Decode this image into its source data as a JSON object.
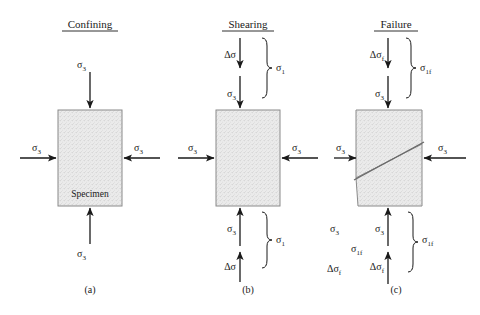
{
  "figure": {
    "background": "#ffffff",
    "ink": "#1a1a1a",
    "specimen_fill": "#e8e8e8",
    "specimen_border": "#888888"
  },
  "panels": [
    {
      "id": "a",
      "title": "Confining",
      "caption": "(a)",
      "specimen_label": "Specimen",
      "arrows": {
        "top": "σ",
        "top_sub": "3",
        "bottom": "σ",
        "bottom_sub": "3",
        "left": "σ",
        "left_sub": "3",
        "right": "σ",
        "right_sub": "3"
      },
      "has_failure_plane": false,
      "has_brace": false
    },
    {
      "id": "b",
      "title": "Shearing",
      "caption": "(b)",
      "specimen_label": "",
      "arrows": {
        "top_outer": "Δσ",
        "top_inner": "σ",
        "top_inner_sub": "3",
        "bottom_inner": "σ",
        "bottom_inner_sub": "3",
        "bottom_outer": "Δσ",
        "left": "σ",
        "left_sub": "3",
        "right": "σ",
        "right_sub": "3"
      },
      "brace_top_label": "σ",
      "brace_top_sub": "1",
      "brace_bottom_label": "σ",
      "brace_bottom_sub": "1",
      "has_failure_plane": false,
      "has_brace": true
    },
    {
      "id": "c",
      "title": "Failure",
      "caption": "(c)",
      "specimen_label": "",
      "arrows": {
        "top_outer": "Δσ",
        "top_outer_sub": "f",
        "top_inner": "σ",
        "top_inner_sub": "3",
        "bottom_inner": "σ",
        "bottom_inner_sub": "3",
        "bottom_outer": "Δσ",
        "bottom_outer_sub": "f",
        "left": "σ",
        "left_sub": "3",
        "right": "σ",
        "right_sub": "3"
      },
      "brace_top_label": "σ",
      "brace_top_sub": "1f",
      "brace_bottom_label": "σ",
      "brace_bottom_sub": "1f",
      "side_stack": [
        {
          "base": "σ",
          "sub": "3"
        },
        {
          "base": "σ",
          "sub": "1f"
        },
        {
          "base": "Δσ",
          "sub": "f"
        }
      ],
      "has_failure_plane": true,
      "has_brace": true
    }
  ]
}
